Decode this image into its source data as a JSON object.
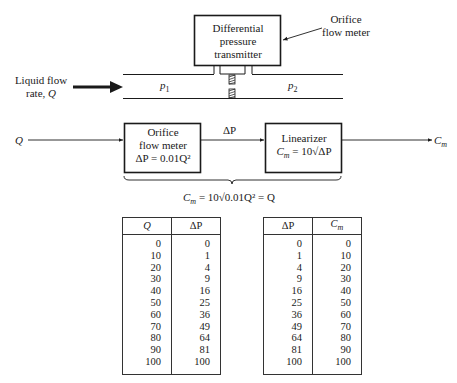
{
  "physical_diagram": {
    "transmitter_label_lines": [
      "Differential",
      "pressure",
      "transmitter"
    ],
    "callout_label_lines": [
      "Orifice",
      "flow meter"
    ],
    "inlet_label_lines": [
      "Liquid flow",
      "rate, "
    ],
    "inlet_symbol": "Q",
    "upstream_pressure": "p",
    "upstream_sub": "1",
    "downstream_pressure": "p",
    "downstream_sub": "2"
  },
  "block_diagram": {
    "input_label": "Q",
    "output_label": "C",
    "output_sub": "m",
    "block1": {
      "lines": [
        "Orifice",
        "flow meter"
      ],
      "equation": "ΔP = 0.01Q²"
    },
    "connector_label": "ΔP",
    "block2": {
      "lines": [
        "Linearizer"
      ],
      "equation_lhs": "C",
      "equation_lhs_sub": "m",
      "equation_rhs": " = 10√ΔP"
    },
    "overall_equation_lhs": "C",
    "overall_equation_lhs_sub": "m",
    "overall_equation_rhs": " = 10√0.01Q² = Q"
  },
  "tables": [
    {
      "headers": [
        "Q",
        "ΔP"
      ],
      "rows": [
        [
          "0",
          "0"
        ],
        [
          "10",
          "1"
        ],
        [
          "20",
          "4"
        ],
        [
          "30",
          "9"
        ],
        [
          "40",
          "16"
        ],
        [
          "50",
          "25"
        ],
        [
          "60",
          "36"
        ],
        [
          "70",
          "49"
        ],
        [
          "80",
          "64"
        ],
        [
          "90",
          "81"
        ],
        [
          "100",
          "100"
        ]
      ]
    },
    {
      "headers": [
        "ΔP",
        "Cm"
      ],
      "rows": [
        [
          "0",
          "0"
        ],
        [
          "1",
          "10"
        ],
        [
          "4",
          "20"
        ],
        [
          "9",
          "30"
        ],
        [
          "16",
          "40"
        ],
        [
          "25",
          "50"
        ],
        [
          "36",
          "60"
        ],
        [
          "49",
          "70"
        ],
        [
          "64",
          "80"
        ],
        [
          "81",
          "90"
        ],
        [
          "100",
          "100"
        ]
      ]
    }
  ]
}
